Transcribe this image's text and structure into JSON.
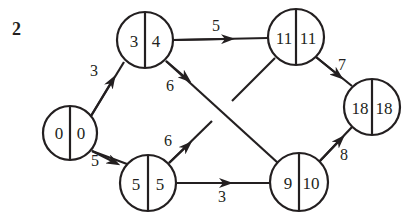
{
  "question_number": "2",
  "nodes": [
    {
      "id": "n0",
      "earliest": "0",
      "latest": "0"
    },
    {
      "id": "n1",
      "earliest": "3",
      "latest": "4"
    },
    {
      "id": "n2",
      "earliest": "5",
      "latest": "5"
    },
    {
      "id": "n3",
      "earliest": "11",
      "latest": "11"
    },
    {
      "id": "n4",
      "earliest": "9",
      "latest": "10"
    },
    {
      "id": "n5",
      "earliest": "18",
      "latest": "18"
    }
  ],
  "edges": [
    {
      "from": "0|0",
      "to": "3|4",
      "weight": "3"
    },
    {
      "from": "0|0",
      "to": "5|5",
      "weight": "5"
    },
    {
      "from": "3|4",
      "to": "11|11",
      "weight": "5"
    },
    {
      "from": "3|4",
      "to": "9|10",
      "weight": "6"
    },
    {
      "from": "5|5",
      "to": "11|11",
      "weight": "6"
    },
    {
      "from": "5|5",
      "to": "9|10",
      "weight": "3"
    },
    {
      "from": "11|11",
      "to": "18|18",
      "weight": "7"
    },
    {
      "from": "9|10",
      "to": "18|18",
      "weight": "8"
    }
  ],
  "colors": {
    "ink": "#231f20",
    "background": "#ffffff"
  }
}
